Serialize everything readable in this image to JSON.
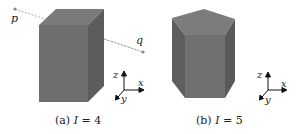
{
  "figure": {
    "panels": [
      {
        "id": "a",
        "caption_prefix": "(a) ",
        "caption_var": "I",
        "caption_eq": " = 4",
        "shape": "rectangular prism",
        "points": [
          {
            "label": "p"
          },
          {
            "label": "q"
          }
        ],
        "axes": {
          "x": "x",
          "y": "y",
          "z": "z"
        }
      },
      {
        "id": "b",
        "caption_prefix": "(b) ",
        "caption_var": "I",
        "caption_eq": " = 5",
        "shape": "pentagonal prism",
        "axes": {
          "x": "x",
          "y": "y",
          "z": "z"
        }
      }
    ],
    "colors": {
      "front": "#707070",
      "side": "#5e5e5e",
      "top": "#7c7c7c",
      "line": "#9a9a9a",
      "point": "#888888"
    }
  }
}
